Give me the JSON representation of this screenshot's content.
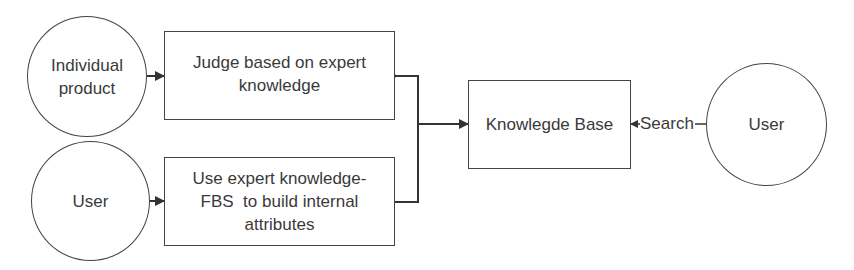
{
  "diagram": {
    "nodes": {
      "individual_product": {
        "label": "Individual product",
        "shape": "circle"
      },
      "user_left": {
        "label": "User",
        "shape": "circle"
      },
      "judge_box": {
        "label": "Judge based on expert knowledge",
        "shape": "rectangle"
      },
      "fbs_box": {
        "label": "Use expert knowledge-FBS to build internal attributes",
        "shape": "rectangle"
      },
      "knowledge_base": {
        "label": "Knowlegde Base",
        "shape": "rectangle"
      },
      "user_right": {
        "label": "User",
        "shape": "circle"
      }
    },
    "edges": [
      {
        "from": "individual_product",
        "to": "judge_box",
        "label": ""
      },
      {
        "from": "user_left",
        "to": "fbs_box",
        "label": ""
      },
      {
        "from": "judge_box",
        "to": "knowledge_base",
        "label": ""
      },
      {
        "from": "fbs_box",
        "to": "knowledge_base",
        "label": ""
      },
      {
        "from": "user_right",
        "to": "knowledge_base",
        "label": "Search"
      }
    ],
    "text": {
      "judge_line1": "Judge based on expert",
      "judge_line2": "knowledge",
      "fbs_line1": "Use expert knowledge-",
      "fbs_line2": "FBS  to build internal",
      "fbs_line3": "attributes",
      "individual_line1": "Individual",
      "individual_line2": "product",
      "search_label": "Search"
    },
    "colors": {
      "stroke": "#444444",
      "text": "#3a3a3a",
      "background": "#ffffff"
    }
  }
}
